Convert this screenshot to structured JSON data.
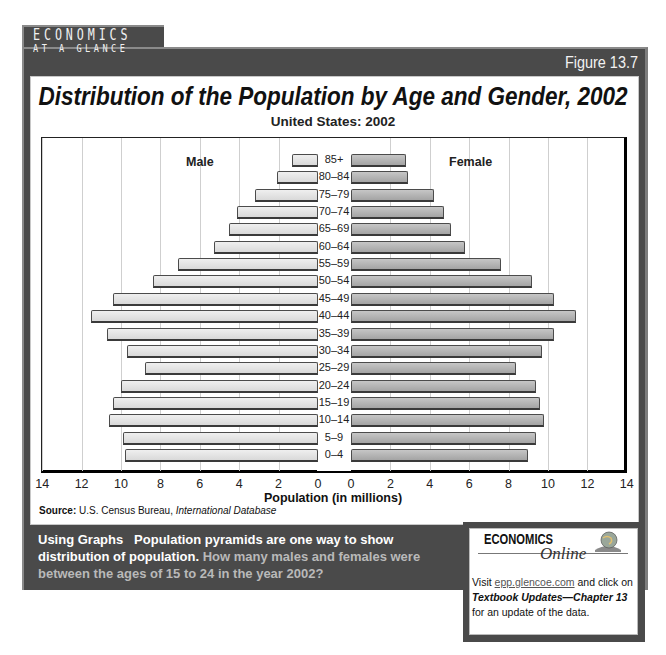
{
  "header": {
    "brand_line1": "ECONOMICS",
    "brand_line2": "AT A GLANCE",
    "figure_label": "Figure 13.7"
  },
  "chart_data": {
    "type": "bar",
    "subtype": "population-pyramid",
    "title": "Distribution of the Population by Age and Gender, 2002",
    "subtitle": "United States: 2002",
    "xlabel": "Population (in millions)",
    "ylabel": "",
    "xlim": [
      0,
      14
    ],
    "x_ticks_left": [
      "14",
      "12",
      "10",
      "8",
      "6",
      "4",
      "2",
      "0"
    ],
    "x_ticks_right": [
      "0",
      "2",
      "4",
      "6",
      "8",
      "10",
      "12",
      "14"
    ],
    "grid": true,
    "categories": [
      "85+",
      "80–84",
      "75–79",
      "70–74",
      "65–69",
      "60–64",
      "55–59",
      "50–54",
      "45–49",
      "40–44",
      "35–39",
      "30–34",
      "25–29",
      "20–24",
      "15–19",
      "10–14",
      "5–9",
      "0–4"
    ],
    "series": [
      {
        "name": "Male",
        "side": "left",
        "color": "#e4e4e4",
        "values": [
          1.3,
          2.1,
          3.2,
          4.1,
          4.5,
          5.3,
          7.1,
          8.4,
          10.4,
          11.5,
          10.7,
          9.7,
          8.8,
          10.0,
          10.4,
          10.6,
          9.9,
          9.8
        ]
      },
      {
        "name": "Female",
        "side": "right",
        "color": "#b5b5b5",
        "values": [
          2.8,
          2.9,
          4.2,
          4.7,
          5.1,
          5.8,
          7.6,
          9.2,
          10.3,
          11.4,
          10.3,
          9.7,
          8.4,
          9.4,
          9.6,
          9.8,
          9.4,
          9.0
        ]
      }
    ],
    "legend": [
      "Male",
      "Female"
    ]
  },
  "source": {
    "label": "Source:",
    "text": "U.S. Census Bureau,",
    "italic": "International Database"
  },
  "question": {
    "lead": "Using Graphs",
    "statement": "Population pyramids are one way to show distribution of population.",
    "ask": "How many males and females were between the ages of 15 to 24 in the year 2002?"
  },
  "online": {
    "logo": "ECONOMICS",
    "script": "Online",
    "visit": "Visit",
    "link": "epp.glencoe.com",
    "and_click": "and click on",
    "bold_italic": "Textbook Updates—Chapter 13",
    "tail": "for an update of the data."
  },
  "colors": {
    "frame": "#4a4a4a",
    "male_bar": "#e4e4e4",
    "female_bar": "#b5b5b5",
    "question_ask": "#b9b9b9"
  }
}
